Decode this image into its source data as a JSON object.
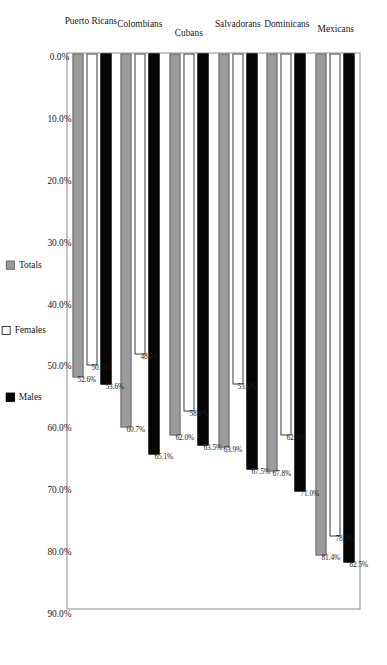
{
  "chart_data": {
    "type": "bar",
    "orientation": "horizontal",
    "title": "",
    "subtitle": "",
    "xlabel": "",
    "ylabel": "",
    "grid": false,
    "legend_position": "bottom",
    "axis_ticks": [
      "90.0%",
      "80.0%",
      "70.0%",
      "60.0%",
      "50.0%",
      "40.0%",
      "30.0%",
      "20.0%",
      "10.0%",
      "0.0%"
    ],
    "axis_tick_values": [
      90.0,
      80.0,
      70.0,
      60.0,
      50.0,
      40.0,
      30.0,
      20.0,
      10.0,
      0.0
    ],
    "ylim": [
      0,
      90
    ],
    "categories": [
      "Mexicans",
      "Dominicans",
      "Salvadorans",
      "Cubans",
      "Colombians",
      "Puerto Ricans"
    ],
    "series": [
      {
        "name": "Males",
        "color": "#050505",
        "values": [
          82.5,
          71.0,
          67.5,
          63.5,
          65.1,
          53.6
        ],
        "labels": [
          "82.5%",
          "71.0%",
          "67.5%",
          "63.5%",
          "65.1%",
          "53.6%"
        ]
      },
      {
        "name": "Females",
        "color": "#ffffff",
        "values": [
          78.3,
          62.0,
          53.6,
          58.1,
          48.8,
          50.6
        ],
        "labels": [
          "78.3%",
          "62.0%",
          "53.6%",
          "58.1%",
          "48.8%",
          "50.6%"
        ]
      },
      {
        "name": "Totals",
        "color": "#9b9b9b",
        "values": [
          81.4,
          67.8,
          63.9,
          62.0,
          60.7,
          52.6
        ],
        "labels": [
          "81.4%",
          "67.8%",
          "63.9%",
          "62.0%",
          "60.7%",
          "52.6%"
        ]
      }
    ]
  },
  "legend": {
    "items": [
      {
        "label": "Males",
        "swatch": "males-swatch"
      },
      {
        "label": "Females",
        "swatch": "females-swatch"
      },
      {
        "label": "Totals",
        "swatch": "totals-swatch"
      }
    ]
  }
}
